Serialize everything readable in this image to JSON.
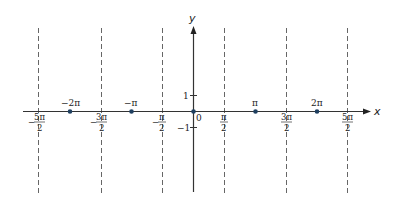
{
  "diagram": {
    "title": "",
    "axes": {
      "x_label": "x",
      "y_label": "y",
      "y_ticks": [
        {
          "value": 1,
          "label": "1"
        },
        {
          "value": -1,
          "label": "−1"
        }
      ],
      "origin_label": "0"
    },
    "asymptotes": [
      {
        "x": "-5pi/2",
        "sign": "−",
        "num": "5π",
        "den": "2"
      },
      {
        "x": "-3pi/2",
        "sign": "−",
        "num": "3π",
        "den": "2"
      },
      {
        "x": "-pi/2",
        "sign": "−",
        "num": "π",
        "den": "2"
      },
      {
        "x": "pi/2",
        "sign": "",
        "num": "π",
        "den": "2"
      },
      {
        "x": "3pi/2",
        "sign": "",
        "num": "3π",
        "den": "2"
      },
      {
        "x": "5pi/2",
        "sign": "",
        "num": "5π",
        "den": "2"
      }
    ],
    "points": [
      {
        "x": "-2pi",
        "label": "−2π"
      },
      {
        "x": "-pi",
        "label": "−π"
      },
      {
        "x": "0",
        "label": ""
      },
      {
        "x": "pi",
        "label": "π"
      },
      {
        "x": "2pi",
        "label": "2π"
      }
    ],
    "colors": {
      "axis": "#333333",
      "asymptote": "#666666",
      "point": "#1f3f5f"
    }
  }
}
